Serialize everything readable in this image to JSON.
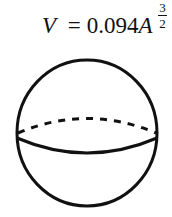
{
  "formula": {
    "lhs": "V",
    "equals": "=",
    "coefficient": "0.094",
    "variable": "A",
    "exponent": {
      "numerator": "3",
      "denominator": "2"
    }
  },
  "figure": {
    "shape": "sphere",
    "equator_front": "solid",
    "equator_back": "dashed",
    "stroke_color": "#111111"
  }
}
